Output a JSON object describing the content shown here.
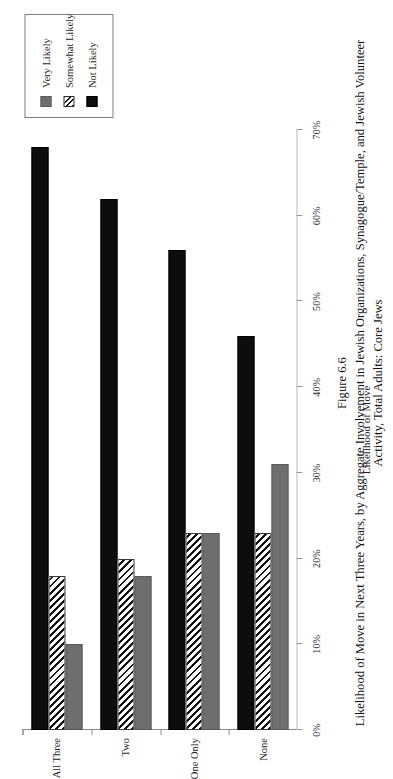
{
  "figure": {
    "number": "Figure 6.6",
    "title": "Likelihood of Move in Next Three Years, by Aggregate Involvement in Jewish Organizations, Synagogue/Temple, and Jewish Volunteer Activity, Total Adults: Core Jews"
  },
  "legend": {
    "position": "top-right",
    "entries": [
      {
        "label": "Very Likely",
        "swatch": "solid-gray-swatch",
        "color": "#6e6e6e"
      },
      {
        "label": "Somewhat Likely",
        "swatch": "diagonal-hatch-swatch",
        "color": "#111111"
      },
      {
        "label": "Not Likely",
        "swatch": "solid-black-swatch",
        "color": "#0d0d0d"
      }
    ]
  },
  "axes": {
    "value_axis_title": "Likelihood of Move",
    "value_ticks": [
      "0%",
      "10%",
      "20%",
      "30%",
      "40%",
      "50%",
      "60%",
      "70%"
    ],
    "category_ticks": [
      "None",
      "One Only",
      "Two",
      "All Three"
    ]
  },
  "chart_data": {
    "type": "bar",
    "orientation": "horizontal",
    "title": "Likelihood of Move in Next Three Years, by Aggregate Involvement in Jewish Organizations, Synagogue/Temple, and Jewish Volunteer Activity, Total Adults: Core Jews",
    "subtitle": "Figure 6.6",
    "xlabel": "Likelihood of Move",
    "ylabel": "",
    "xlim": [
      0,
      70
    ],
    "grid": false,
    "legend_position": "top-right",
    "categories": [
      "None",
      "One Only",
      "Two",
      "All Three"
    ],
    "series": [
      {
        "name": "Very Likely",
        "color": "#6e6e6e",
        "values": [
          31,
          23,
          18,
          10
        ]
      },
      {
        "name": "Somewhat Likely",
        "color": "#111111",
        "values": [
          23,
          23,
          20,
          18
        ]
      },
      {
        "name": "Not Likely",
        "color": "#0d0d0d",
        "values": [
          46,
          56,
          62,
          68
        ]
      }
    ],
    "tick_labels": [
      "0%",
      "10%",
      "20%",
      "30%",
      "40%",
      "50%",
      "60%",
      "70%"
    ],
    "tick_values": [
      0,
      10,
      20,
      30,
      40,
      50,
      60,
      70
    ]
  }
}
